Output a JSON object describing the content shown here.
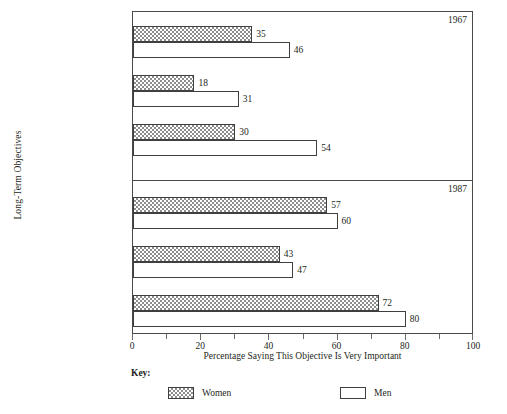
{
  "chart_data": {
    "type": "bar",
    "orientation": "horizontal",
    "title": "",
    "xlabel": "Percentage Saying This Objective Is Very Important",
    "ylabel": "Long-Term Objectives",
    "xlim": [
      0,
      100
    ],
    "xticks": [
      0,
      20,
      40,
      60,
      80,
      100
    ],
    "xtick_labels": [
      "0",
      "20",
      "40",
      "60",
      "80",
      "100"
    ],
    "minor_xticks": [
      10,
      30,
      50,
      70,
      90
    ],
    "grid": false,
    "legend_position": "bottom",
    "legend_title": "Key:",
    "series": [
      {
        "name": "Women",
        "pattern": "checkered",
        "color": "#8d8d8d"
      },
      {
        "name": "Men",
        "pattern": "solid",
        "color": "#ffffff"
      }
    ],
    "categories": [
      "Obtain Recognition",
      "Have Administrative Responsibility",
      "Be Financially Very Well Off"
    ],
    "panels": [
      {
        "year": "1967",
        "groups": [
          {
            "category": "Obtain Recognition",
            "label_lines": [
              "Obtain Recognition"
            ],
            "women": 35,
            "men": 46
          },
          {
            "category": "Have Administrative Responsibility",
            "label_lines": [
              "Have Administrative",
              "Responsibility"
            ],
            "women": 18,
            "men": 31
          },
          {
            "category": "Be Financially Very Well Off",
            "label_lines": [
              "Be Financially",
              "Very Well Off"
            ],
            "women": 30,
            "men": 54
          }
        ]
      },
      {
        "year": "1987",
        "groups": [
          {
            "category": "Obtain Recognition",
            "label_lines": [
              "Obtain Recognition"
            ],
            "women": 57,
            "men": 60
          },
          {
            "category": "Have Administrative Responsibility",
            "label_lines": [
              "Have Administrative",
              "Responsibility"
            ],
            "women": 43,
            "men": 47
          },
          {
            "category": "Be Financially Very Well Off",
            "label_lines": [
              "Be Financially",
              "Very Well Off"
            ],
            "women": 72,
            "men": 80
          }
        ]
      }
    ]
  },
  "axes": {
    "y_title": "Long-Term Objectives",
    "x_title": "Percentage Saying This Objective Is Very Important",
    "x_tick_labels": [
      "0",
      "20",
      "40",
      "60",
      "80",
      "100"
    ]
  },
  "panel_years": {
    "top": "1967",
    "bottom": "1987"
  },
  "legend": {
    "title": "Key:",
    "entries": [
      {
        "label": "Women",
        "swatch": "checkered-swatch"
      },
      {
        "label": "Men",
        "swatch": "white-swatch"
      }
    ]
  },
  "colors": {
    "axis": "#4a4a4a",
    "bar_outline": "#3f3f3f",
    "hatch": "#8d8d8d",
    "text": "#231f20",
    "background": "#ffffff"
  }
}
